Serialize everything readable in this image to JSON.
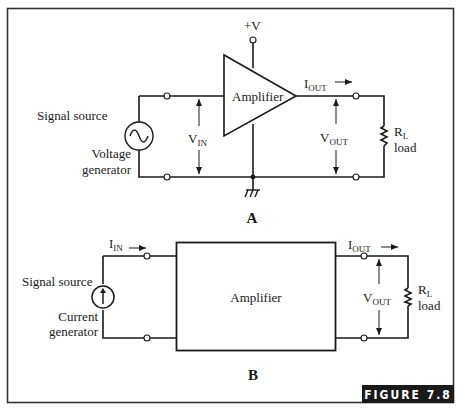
{
  "figure": {
    "label": "FIGURE 7.8",
    "label_bg": "#1a1a1a",
    "label_fg": "#ffffff"
  },
  "panel_a": {
    "part_label": "A",
    "supply_label": "+V",
    "amplifier_label": "Amplifier",
    "amplifier_shape": "triangle",
    "source_label_1": "Signal source",
    "source_label_2a": "Voltage",
    "source_label_2b": "generator",
    "source_icon": "ac-voltage-source-icon",
    "vin": {
      "main": "V",
      "sub": "IN"
    },
    "iout": {
      "main": "I",
      "sub": "OUT",
      "arrow": "→"
    },
    "vout": {
      "main": "V",
      "sub": "OUT"
    },
    "load": {
      "main": "R",
      "sub": "L",
      "text": "load"
    },
    "ground_icon": "chassis-ground-icon"
  },
  "panel_b": {
    "part_label": "B",
    "amplifier_label": "Amplifier",
    "amplifier_shape": "rectangle",
    "source_label_1": "Signal source",
    "source_label_2a": "Current",
    "source_label_2b": "generator",
    "source_icon": "current-source-icon",
    "iin": {
      "main": "I",
      "sub": "IN",
      "arrow": "→"
    },
    "iout": {
      "main": "I",
      "sub": "OUT",
      "arrow": "→"
    },
    "vout": {
      "main": "V",
      "sub": "OUT"
    },
    "load": {
      "main": "R",
      "sub": "L",
      "text": "load"
    }
  }
}
